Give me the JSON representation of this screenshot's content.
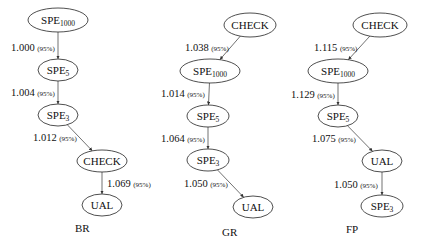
{
  "graphs": [
    {
      "label": "BR",
      "label_pos": [
        75,
        232
      ],
      "nodes": [
        {
          "id": "br-spe1000",
          "base": "SPE",
          "sub": "1000",
          "cx": 58,
          "cy": 20,
          "rx": 30,
          "ry": 12
        },
        {
          "id": "br-spe5",
          "base": "SPE",
          "sub": "5",
          "cx": 58,
          "cy": 70,
          "rx": 20,
          "ry": 11
        },
        {
          "id": "br-spe3",
          "base": "SPE",
          "sub": "3",
          "cx": 58,
          "cy": 115,
          "rx": 20,
          "ry": 11
        },
        {
          "id": "br-check",
          "base": "CHECK",
          "sub": "",
          "cx": 102,
          "cy": 161,
          "rx": 25,
          "ry": 11
        },
        {
          "id": "br-ual",
          "base": "UAL",
          "sub": "",
          "cx": 102,
          "cy": 205,
          "rx": 20,
          "ry": 11
        }
      ],
      "edges": [
        {
          "from": "br-spe1000",
          "to": "br-spe5",
          "value": "1.000",
          "conf": "(95%)",
          "lx": 11,
          "ly": 51
        },
        {
          "from": "br-spe5",
          "to": "br-spe3",
          "value": "1.004",
          "conf": "(95%)",
          "lx": 11,
          "ly": 96
        },
        {
          "from": "br-spe3",
          "to": "br-check",
          "value": "1.012",
          "conf": "(95%)",
          "lx": 33,
          "ly": 141
        },
        {
          "from": "br-check",
          "to": "br-ual",
          "value": "1.069",
          "conf": "(95%)",
          "lx": 107,
          "ly": 187
        }
      ]
    },
    {
      "label": "GR",
      "label_pos": [
        222,
        236
      ],
      "nodes": [
        {
          "id": "gr-check",
          "base": "CHECK",
          "sub": "",
          "cx": 250,
          "cy": 25,
          "rx": 26,
          "ry": 12
        },
        {
          "id": "gr-spe1000",
          "base": "SPE",
          "sub": "1000",
          "cx": 210,
          "cy": 71,
          "rx": 30,
          "ry": 12
        },
        {
          "id": "gr-spe5",
          "base": "SPE",
          "sub": "5",
          "cx": 208,
          "cy": 116,
          "rx": 21,
          "ry": 11
        },
        {
          "id": "gr-spe3",
          "base": "SPE",
          "sub": "3",
          "cx": 208,
          "cy": 160,
          "rx": 21,
          "ry": 11
        },
        {
          "id": "gr-ual",
          "base": "UAL",
          "sub": "",
          "cx": 253,
          "cy": 207,
          "rx": 20,
          "ry": 11
        }
      ],
      "edges": [
        {
          "from": "gr-check",
          "to": "gr-spe1000",
          "value": "1.038",
          "conf": "(95%)",
          "lx": 185,
          "ly": 51
        },
        {
          "from": "gr-spe1000",
          "to": "gr-spe5",
          "value": "1.014",
          "conf": "(95%)",
          "lx": 161,
          "ly": 97
        },
        {
          "from": "gr-spe5",
          "to": "gr-spe3",
          "value": "1.064",
          "conf": "(95%)",
          "lx": 161,
          "ly": 142
        },
        {
          "from": "gr-spe3",
          "to": "gr-ual",
          "value": "1.050",
          "conf": "(95%)",
          "lx": 184,
          "ly": 187
        }
      ]
    },
    {
      "label": "FP",
      "label_pos": [
        346,
        233
      ],
      "nodes": [
        {
          "id": "fp-check",
          "base": "CHECK",
          "sub": "",
          "cx": 380,
          "cy": 25,
          "rx": 27,
          "ry": 12
        },
        {
          "id": "fp-spe1000",
          "base": "SPE",
          "sub": "1000",
          "cx": 338,
          "cy": 71,
          "rx": 30,
          "ry": 12
        },
        {
          "id": "fp-spe5",
          "base": "SPE",
          "sub": "5",
          "cx": 338,
          "cy": 116,
          "rx": 20,
          "ry": 11
        },
        {
          "id": "fp-ual",
          "base": "UAL",
          "sub": "",
          "cx": 382,
          "cy": 161,
          "rx": 20,
          "ry": 11
        },
        {
          "id": "fp-spe3",
          "base": "SPE",
          "sub": "3",
          "cx": 382,
          "cy": 206,
          "rx": 21,
          "ry": 11
        }
      ],
      "edges": [
        {
          "from": "fp-check",
          "to": "fp-spe1000",
          "value": "1.115",
          "conf": "(95%)",
          "lx": 314,
          "ly": 51
        },
        {
          "from": "fp-spe1000",
          "to": "fp-spe5",
          "value": "1.129",
          "conf": "(95%)",
          "lx": 291,
          "ly": 98
        },
        {
          "from": "fp-spe5",
          "to": "fp-ual",
          "value": "1.075",
          "conf": "(95%)",
          "lx": 312,
          "ly": 142
        },
        {
          "from": "fp-ual",
          "to": "fp-spe3",
          "value": "1.050",
          "conf": "(95%)",
          "lx": 334,
          "ly": 188
        }
      ]
    }
  ]
}
